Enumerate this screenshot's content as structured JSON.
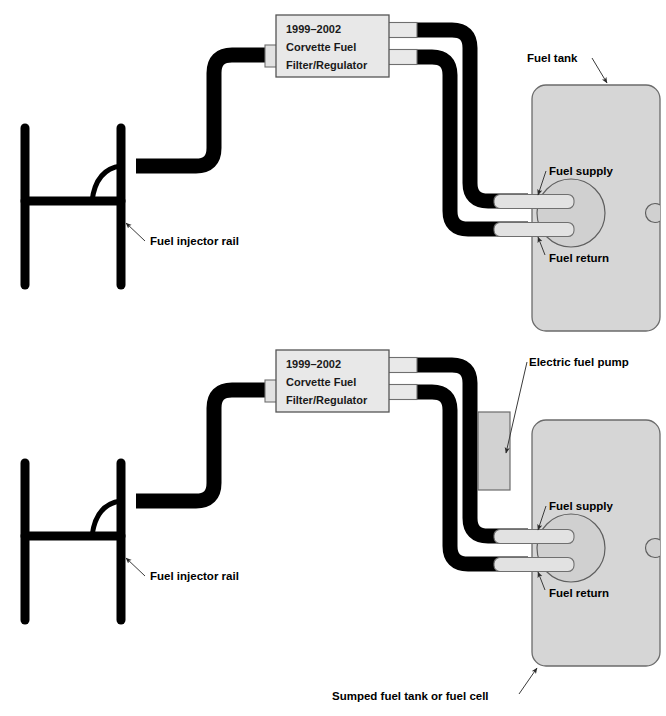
{
  "figure": {
    "colors": {
      "hose": "#000000",
      "tank_fill": "#d6d6d6",
      "tank_stroke": "#6b6b6b",
      "fitting_fill": "#e2e2e2",
      "fitting_stroke": "#7a7a7a",
      "box_fill": "#e8e8e8",
      "box_stroke": "#555555",
      "pump_fill": "#d2d2d2",
      "pump_stroke": "#6b6b6b",
      "text": "#000000",
      "leader": "#3a3a3a"
    }
  },
  "diagrams": [
    {
      "id": "returnless-stock-tank",
      "regulator": {
        "lines": [
          "1999–2002",
          "Corvette Fuel",
          "Filter/Regulator"
        ]
      },
      "labels": {
        "fuel_tank": "Fuel tank",
        "fuel_supply": "Fuel supply",
        "fuel_return": "Fuel return",
        "fuel_injector_rail": "Fuel injector rail"
      }
    },
    {
      "id": "sumped-tank-with-external-pump",
      "regulator": {
        "lines": [
          "1999–2002",
          "Corvette Fuel",
          "Filter/Regulator"
        ]
      },
      "labels": {
        "electric_fuel_pump": "Electric fuel pump",
        "fuel_supply": "Fuel supply",
        "fuel_return": "Fuel return",
        "fuel_injector_rail": "Fuel injector rail",
        "sumped_tank": "Sumped fuel tank or fuel cell"
      }
    }
  ]
}
